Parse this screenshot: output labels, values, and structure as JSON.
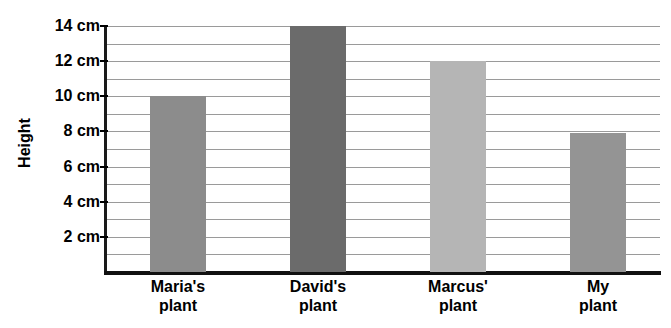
{
  "chart_data": {
    "type": "bar",
    "title": "",
    "xlabel": "",
    "ylabel": "Height",
    "categories": [
      "Maria's\nplant",
      "David's\nplant",
      "Marcus'\nplant",
      "My\nplant"
    ],
    "category_lines": [
      {
        "line1": "Maria's",
        "line2": "plant"
      },
      {
        "line1": "David's",
        "line2": "plant"
      },
      {
        "line1": "Marcus'",
        "line2": "plant"
      },
      {
        "line1": "My",
        "line2": "plant"
      }
    ],
    "values": [
      10,
      14,
      12,
      7.9
    ],
    "value_unit": "cm",
    "ylim": [
      0,
      14
    ],
    "y_tick_labels": [
      "14 cm",
      "12 cm",
      "10 cm",
      "8 cm",
      "6 cm",
      "4 cm",
      "2 cm"
    ],
    "y_tick_values": [
      14,
      12,
      10,
      8,
      6,
      4,
      2
    ],
    "gridline_values": [
      14,
      13,
      12,
      11,
      10,
      9,
      8,
      7,
      6,
      5,
      4,
      3,
      2,
      1
    ],
    "grid": true,
    "legend": "none",
    "bar_colors": [
      "#8c8c8c",
      "#6b6b6b",
      "#b5b5b5",
      "#949494"
    ],
    "axis_color": "#111111",
    "gridline_color": "#9a9a9a",
    "background": "#ffffff"
  }
}
